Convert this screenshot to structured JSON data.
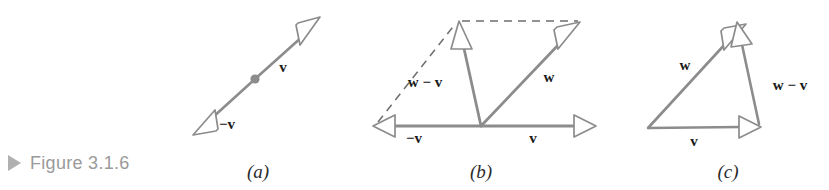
{
  "figure": {
    "caption": "Figure 3.1.6",
    "caption_marker_icon": "triangle-right-icon",
    "background_color": "#ffffff",
    "stroke_color": "#8c8c8c",
    "label_color": "#1b1b1b",
    "caption_color": "#9a9a9a",
    "caption_marker_color": "#b0b0b0"
  },
  "panels": [
    {
      "id": "a",
      "label": "(a)",
      "label_x": 258,
      "label_y": 172,
      "description": "double-headed arrow showing v and its negative -v through a common point",
      "vectors": [
        {
          "name": "v",
          "label": "v",
          "label_x": 283,
          "label_y": 72,
          "x1": 255,
          "y1": 79,
          "x2": 311,
          "y2": 28,
          "style": "solid",
          "arrow": "end"
        },
        {
          "name": "-v",
          "label": "−v",
          "label_x": 224,
          "label_y": 128,
          "x1": 255,
          "y1": 79,
          "x2": 203,
          "y2": 127,
          "style": "solid",
          "arrow": "end"
        }
      ],
      "point": {
        "name": "origin-dot",
        "x": 255,
        "y": 79,
        "r": 4
      }
    },
    {
      "id": "b",
      "label": "(b)",
      "label_x": 480,
      "label_y": 172,
      "description": "parallelogram construction showing w - v as the sum of -v and w",
      "vectors": [
        {
          "name": "-v",
          "label": "−v",
          "label_x": 412,
          "label_y": 142,
          "x1": 480,
          "y1": 126,
          "x2": 376,
          "y2": 126,
          "style": "solid",
          "arrow": "end"
        },
        {
          "name": "v",
          "label": "v",
          "label_x": 533,
          "label_y": 142,
          "x1": 480,
          "y1": 126,
          "x2": 592,
          "y2": 126,
          "style": "solid",
          "arrow": "end"
        },
        {
          "name": "w",
          "label": "w",
          "label_x": 548,
          "label_y": 80,
          "x1": 480,
          "y1": 126,
          "x2": 575,
          "y2": 26,
          "style": "solid",
          "arrow": "end"
        },
        {
          "name": "w-v",
          "label": "w − v",
          "label_x": 418,
          "label_y": 86,
          "x1": 480,
          "y1": 126,
          "x2": 459,
          "y2": 27,
          "style": "solid",
          "arrow": "end"
        }
      ],
      "dashed_lines": [
        {
          "name": "dashed-left-side",
          "x1": 376,
          "y1": 124,
          "x2": 457,
          "y2": 22
        },
        {
          "name": "dashed-top-side",
          "x1": 459,
          "y1": 21,
          "x2": 578,
          "y2": 21
        }
      ]
    },
    {
      "id": "c",
      "label": "(c)",
      "label_x": 727,
      "label_y": 172,
      "description": "triangle construction showing w - v joining the tip of v to the tip of w",
      "vectors": [
        {
          "name": "v",
          "label": "v",
          "label_x": 692,
          "label_y": 145,
          "x1": 648,
          "y1": 128,
          "x2": 757,
          "y2": 127,
          "style": "solid",
          "arrow": "end"
        },
        {
          "name": "w",
          "label": "w",
          "label_x": 686,
          "label_y": 68,
          "x1": 648,
          "y1": 128,
          "x2": 740,
          "y2": 28,
          "style": "solid",
          "arrow": "end"
        },
        {
          "name": "w-v",
          "label": "w − v",
          "label_x": 768,
          "label_y": 89,
          "x1": 740,
          "y1": 33,
          "x2": 760,
          "y2": 122,
          "style": "solid",
          "arrow": "start"
        }
      ]
    }
  ]
}
